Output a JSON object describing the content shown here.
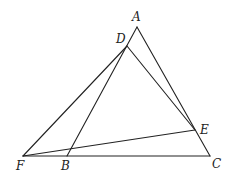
{
  "diagram": {
    "type": "geometry",
    "points": {
      "A": {
        "label": "A",
        "x": 137,
        "y": 27,
        "lx": 132,
        "ly": 21
      },
      "D": {
        "label": "D",
        "x": 127,
        "y": 46,
        "lx": 116,
        "ly": 43
      },
      "E": {
        "label": "E",
        "x": 195,
        "y": 130,
        "lx": 200,
        "ly": 134
      },
      "F": {
        "label": "F",
        "x": 23,
        "y": 156,
        "lx": 16,
        "ly": 170
      },
      "B": {
        "label": "B",
        "x": 67,
        "y": 156,
        "lx": 61,
        "ly": 170
      },
      "C": {
        "label": "C",
        "x": 210,
        "y": 156,
        "lx": 212,
        "ly": 168
      }
    },
    "segments": [
      {
        "from": "F",
        "to": "C"
      },
      {
        "from": "A",
        "to": "C"
      },
      {
        "from": "A",
        "to": "B"
      },
      {
        "from": "D",
        "to": "F"
      },
      {
        "from": "D",
        "to": "E"
      },
      {
        "from": "F",
        "to": "E"
      }
    ],
    "stroke_color": "#222222"
  }
}
